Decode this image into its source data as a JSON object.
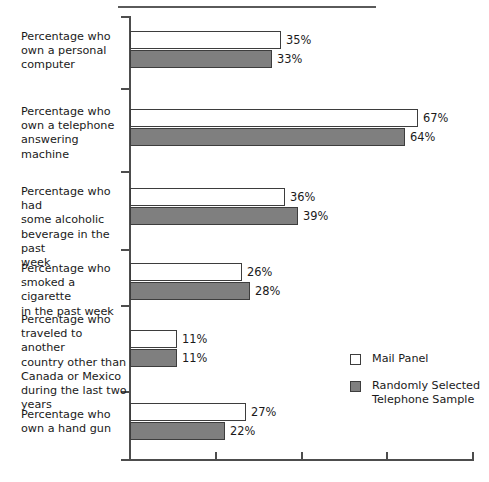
{
  "chart_data": {
    "type": "bar",
    "orientation": "horizontal",
    "title": "",
    "xlabel": "",
    "ylabel": "",
    "xlim": [
      0,
      80
    ],
    "xticks": [
      0,
      20,
      40,
      60,
      80
    ],
    "xtick_labels": [
      "",
      "",
      "",
      "",
      ""
    ],
    "grid": false,
    "value_suffix": "%",
    "legend_position": "right-middle",
    "categories": [
      "Percentage who own a personal computer",
      "Percentage who own a telephone answering machine",
      "Percentage who had some alcoholic beverage in the past week",
      "Percentage who smoked a cigarette in the past week",
      "Percentage who traveled to another country other than Canada or Mexico during the last two years",
      "Percentage who own a hand gun"
    ],
    "series": [
      {
        "name": "Mail Panel",
        "color": "#ffffff",
        "values": [
          35,
          67,
          36,
          26,
          11,
          27
        ]
      },
      {
        "name": "Randomly Selected Telephone Sample",
        "color": "#7f7f7f",
        "values": [
          33,
          64,
          39,
          28,
          11,
          22
        ]
      }
    ]
  },
  "axis": {
    "tick_count": 5
  },
  "categories": [
    {
      "lines": [
        "Percentage who",
        "own a personal",
        "computer"
      ]
    },
    {
      "lines": [
        "Percentage who",
        "own a telephone",
        "answering machine"
      ]
    },
    {
      "lines": [
        "Percentage who had",
        "some alcoholic",
        "beverage in the past",
        "week"
      ]
    },
    {
      "lines": [
        "Percentage who",
        "smoked a cigarette",
        "in the past week"
      ]
    },
    {
      "lines": [
        "Percentage who",
        "traveled to another",
        "country other than",
        "Canada or Mexico",
        "during the last two",
        "years"
      ]
    },
    {
      "lines": [
        "Percentage who",
        "own a hand gun"
      ]
    }
  ],
  "bars": [
    {
      "group": 0,
      "series": "mail",
      "label": "35%"
    },
    {
      "group": 0,
      "series": "phone",
      "label": "33%"
    },
    {
      "group": 1,
      "series": "mail",
      "label": "67%"
    },
    {
      "group": 1,
      "series": "phone",
      "label": "64%"
    },
    {
      "group": 2,
      "series": "mail",
      "label": "36%"
    },
    {
      "group": 2,
      "series": "phone",
      "label": "39%"
    },
    {
      "group": 3,
      "series": "mail",
      "label": "26%"
    },
    {
      "group": 3,
      "series": "phone",
      "label": "28%"
    },
    {
      "group": 4,
      "series": "mail",
      "label": "11%"
    },
    {
      "group": 4,
      "series": "phone",
      "label": "11%"
    },
    {
      "group": 5,
      "series": "mail",
      "label": "27%"
    },
    {
      "group": 5,
      "series": "phone",
      "label": "22%"
    }
  ],
  "legend": {
    "items": [
      {
        "swatch": "mail",
        "lines": [
          "Mail Panel"
        ]
      },
      {
        "swatch": "phone",
        "lines": [
          "Randomly Selected",
          "Telephone Sample"
        ]
      }
    ]
  }
}
